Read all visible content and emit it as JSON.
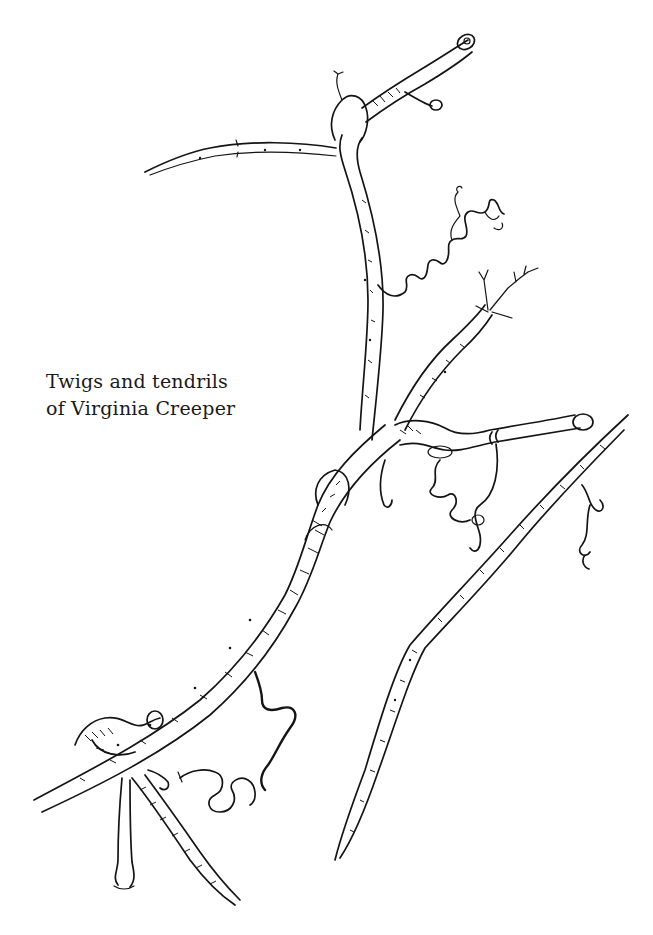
{
  "caption": {
    "line1": "Twigs and tendrils",
    "line2": "of Virginia Creeper"
  },
  "illustration": {
    "subject": "Virginia Creeper twigs and tendrils",
    "style": "pen-and-ink drawing",
    "ink_color": "#141414",
    "background_color": "#ffffff"
  }
}
